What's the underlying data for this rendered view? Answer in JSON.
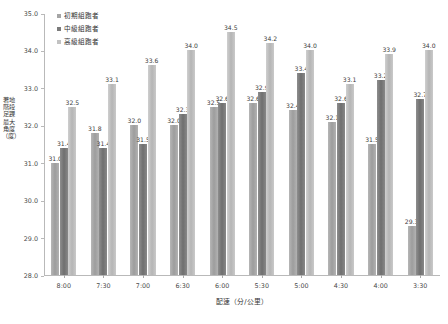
{
  "chart_data": {
    "type": "bar",
    "title": "",
    "xlabel": "配速（分/公里）",
    "ylabel": "著地階段足踝最大角度（度）",
    "categories": [
      "8:00",
      "7:30",
      "7:00",
      "6:30",
      "6:00",
      "5:30",
      "5:00",
      "4:30",
      "4:00",
      "3:30"
    ],
    "ylim": [
      28.0,
      35.0
    ],
    "yticks": [
      "28.0",
      "29.0",
      "30.0",
      "31.0",
      "32.0",
      "33.0",
      "34.0",
      "35.0"
    ],
    "ytick_values": [
      28.0,
      29.0,
      30.0,
      31.0,
      32.0,
      33.0,
      34.0,
      35.0
    ],
    "grid": false,
    "legend_position": "top-left",
    "series": [
      {
        "name": "初期組跑者",
        "color": "#a5a5a5",
        "values": [
          31.0,
          31.8,
          32.0,
          32.0,
          32.5,
          32.6,
          32.4,
          32.1,
          31.5,
          29.3
        ],
        "labels": [
          "31.0",
          "31.8",
          "32.0",
          "32.0",
          "32.5",
          "32.6",
          "32.4",
          "32.1",
          "31.5",
          "29.3"
        ]
      },
      {
        "name": "中級組跑者",
        "color": "#7b7b7b",
        "values": [
          31.4,
          31.4,
          31.5,
          32.3,
          32.6,
          32.9,
          33.4,
          32.6,
          33.2,
          32.7
        ],
        "labels": [
          "31.4",
          "31.4",
          "31.5",
          "32.3",
          "32.6",
          "32.9",
          "33.4",
          "32.6",
          "33.2",
          "32.7"
        ]
      },
      {
        "name": "高級組跑者",
        "color": "#c2c2c2",
        "values": [
          32.5,
          33.1,
          33.6,
          34.0,
          34.5,
          34.2,
          34.0,
          33.1,
          33.9,
          34.0
        ],
        "labels": [
          "32.5",
          "33.1",
          "33.6",
          "34.0",
          "34.5",
          "34.2",
          "34.0",
          "33.1",
          "33.9",
          "34.0"
        ]
      }
    ]
  }
}
